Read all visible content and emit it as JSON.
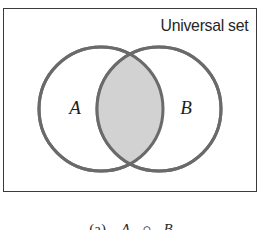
{
  "figure": {
    "kind": "venn-diagram",
    "background_color": "#ffffff"
  },
  "universal_set": {
    "label": "Universal set",
    "border_color": "#3a3a3a",
    "fill_color": "#ffffff"
  },
  "sets": {
    "left": {
      "label": "A",
      "cx": 101,
      "cy": 109,
      "r": 62
    },
    "right": {
      "label": "B",
      "cx": 159,
      "cy": 109,
      "r": 62
    },
    "stroke_color": "#6a6a6a",
    "stroke_width": 3,
    "fill_color": "#ffffff"
  },
  "intersection": {
    "shaded": true,
    "fill_color": "#d2d2d2",
    "meaning": "A ∩ B"
  },
  "caption": {
    "index": "(a)",
    "left_set": "A",
    "operator": "∩",
    "right_set": "B",
    "full": "(a)  A ∩ B"
  }
}
